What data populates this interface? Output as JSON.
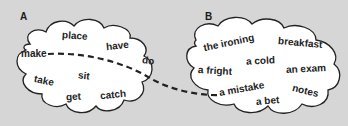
{
  "colors": {
    "background": "#d6d6d6",
    "cloud_fill": "#ffffff",
    "cloud_stroke": "#222222",
    "text": "#222222"
  },
  "cloud_a": {
    "label": "A",
    "words": [
      "place",
      "have",
      "make",
      "do",
      "sit",
      "take",
      "get",
      "catch"
    ]
  },
  "cloud_b": {
    "label": "B",
    "words": [
      "the ironing",
      "breakfast",
      "a cold",
      "a fright",
      "an exam",
      "a mistake",
      "notes",
      "a bet"
    ]
  },
  "connection": {
    "from": "make",
    "to": "a mistake",
    "style": "dashed"
  }
}
